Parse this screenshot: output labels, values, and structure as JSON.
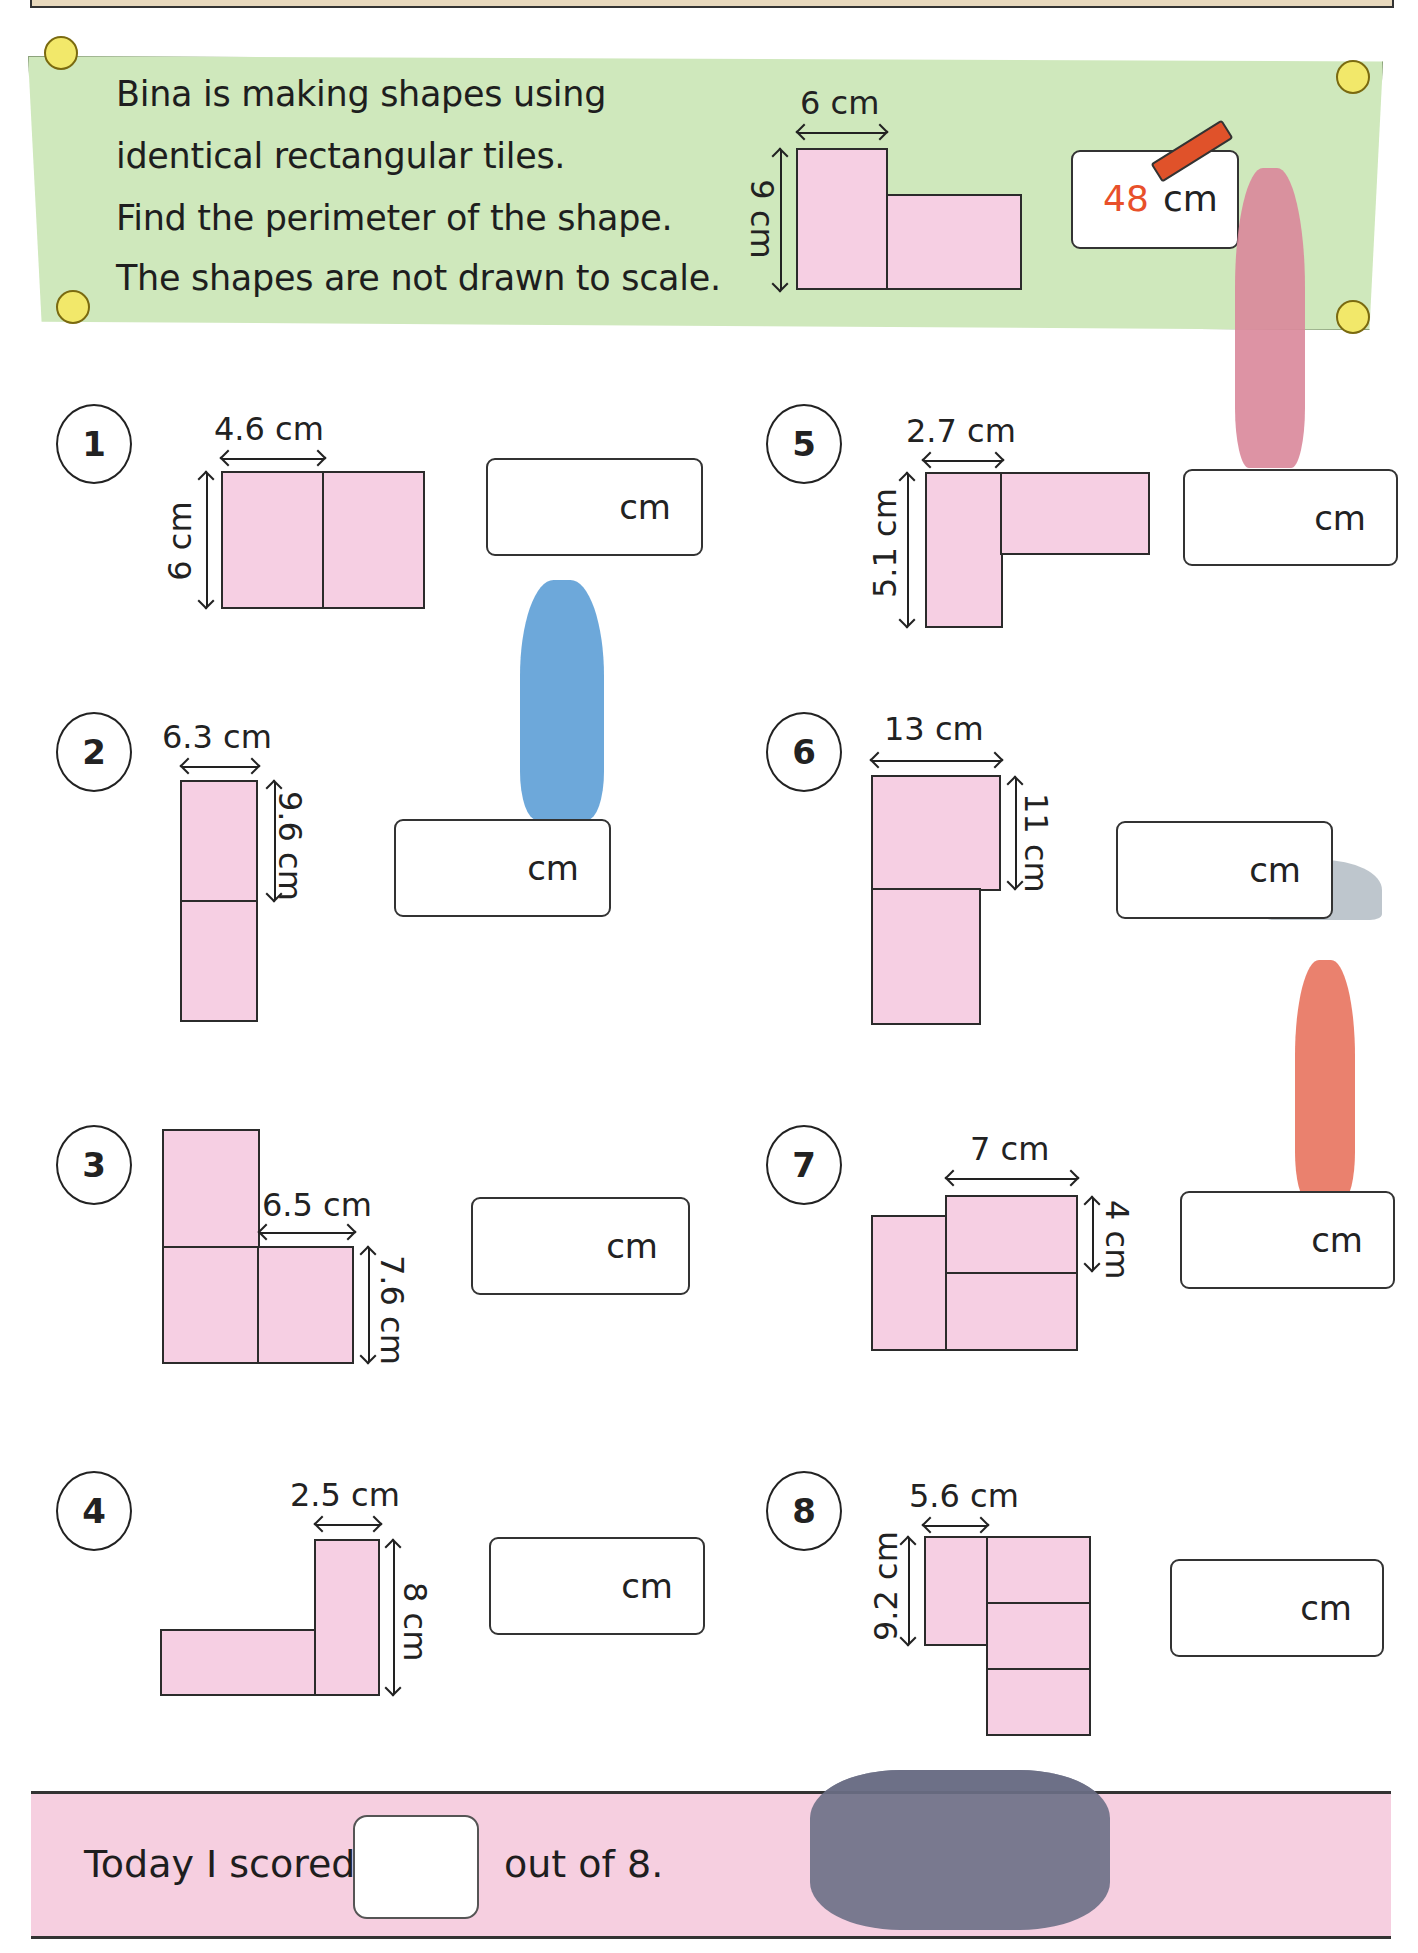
{
  "intro": {
    "lines": [
      "Bina is making shapes using",
      "identical rectangular tiles.",
      "Find the perimeter of the shape.",
      "The shapes are not drawn to scale."
    ],
    "example": {
      "width_label": "6 cm",
      "height_label": "9 cm",
      "answer_value": "48",
      "answer_unit": "cm",
      "answer_color": "#e8502a"
    }
  },
  "questions": [
    {
      "number": "1",
      "width_label": "4.6 cm",
      "height_label": "6 cm",
      "unit": "cm"
    },
    {
      "number": "2",
      "width_label": "6.3 cm",
      "height_label": "9.6 cm",
      "unit": "cm"
    },
    {
      "number": "3",
      "width_label": "6.5 cm",
      "height_label": "7.6 cm",
      "unit": "cm"
    },
    {
      "number": "4",
      "width_label": "2.5 cm",
      "height_label": "8 cm",
      "unit": "cm"
    },
    {
      "number": "5",
      "width_label": "2.7 cm",
      "height_label": "5.1 cm",
      "unit": "cm"
    },
    {
      "number": "6",
      "width_label": "13 cm",
      "height_label": "11 cm",
      "unit": "cm"
    },
    {
      "number": "7",
      "width_label": "7 cm",
      "height_label": "4 cm",
      "unit": "cm"
    },
    {
      "number": "8",
      "width_label": "5.6 cm",
      "height_label": "9.2 cm",
      "unit": "cm"
    }
  ],
  "footer": {
    "prefix": "Today I scored",
    "suffix": "out of 8."
  },
  "colors": {
    "banner_green": "#cfe8bc",
    "tile_pink": "#f6cfe3",
    "footer_pink": "#f6cfe0",
    "answer_red": "#e8502a"
  }
}
